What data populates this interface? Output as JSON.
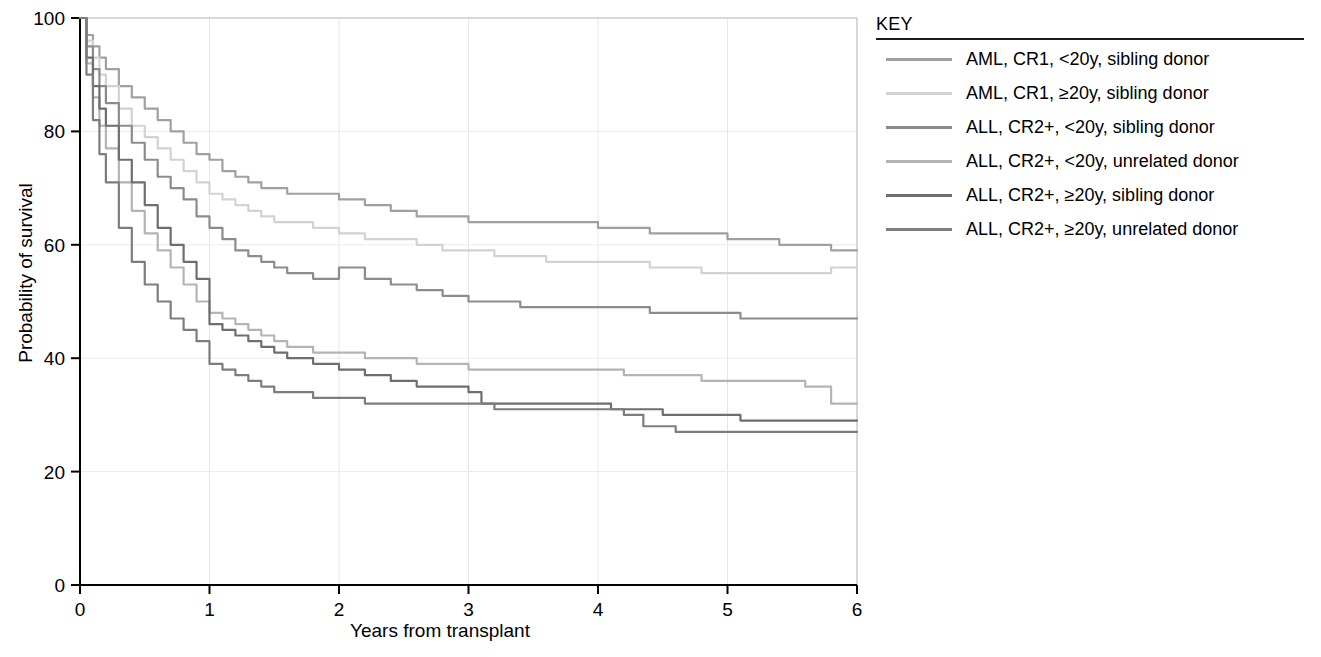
{
  "legend": {
    "title": "KEY",
    "entries": [
      {
        "label": "AML, CR1, <20y, sibling donor",
        "color": "#a0a0a0"
      },
      {
        "label": "AML, CR1, ≥20y, sibling donor",
        "color": "#d2d2d2"
      },
      {
        "label": "ALL, CR2+, <20y, sibling donor",
        "color": "#8c8c8c"
      },
      {
        "label": "ALL, CR2+, <20y, unrelated donor",
        "color": "#b4b4b4"
      },
      {
        "label": "ALL, CR2+, ≥20y, sibling donor",
        "color": "#6e6e6e"
      },
      {
        "label": "ALL, CR2+, ≥20y, unrelated donor",
        "color": "#7d7d7d"
      }
    ]
  },
  "axes": {
    "x_label": "Years from transplant",
    "y_label": "Probability of survival",
    "x_ticks": [
      "0",
      "1",
      "2",
      "3",
      "4",
      "5",
      "6"
    ],
    "y_ticks": [
      "0",
      "20",
      "40",
      "60",
      "80",
      "100"
    ]
  },
  "chart_data": {
    "type": "line",
    "title": "",
    "xlabel": "Years from transplant",
    "ylabel": "Probability of survival",
    "xlim": [
      0,
      6
    ],
    "ylim": [
      0,
      100
    ],
    "x_ticks": [
      0,
      1,
      2,
      3,
      4,
      5,
      6
    ],
    "y_ticks": [
      0,
      20,
      40,
      60,
      80,
      100
    ],
    "grid": true,
    "legend_position": "right",
    "legend_title": "KEY",
    "series": [
      {
        "name": "AML, CR1, <20y, sibling donor",
        "color": "#a0a0a0",
        "points": [
          [
            0.0,
            100
          ],
          [
            0.05,
            97
          ],
          [
            0.1,
            95
          ],
          [
            0.15,
            93
          ],
          [
            0.2,
            91
          ],
          [
            0.3,
            88
          ],
          [
            0.4,
            86
          ],
          [
            0.5,
            84
          ],
          [
            0.6,
            82
          ],
          [
            0.7,
            80
          ],
          [
            0.8,
            78
          ],
          [
            0.9,
            76
          ],
          [
            1.0,
            75
          ],
          [
            1.1,
            73
          ],
          [
            1.2,
            72
          ],
          [
            1.3,
            71
          ],
          [
            1.4,
            70
          ],
          [
            1.5,
            70
          ],
          [
            1.6,
            69
          ],
          [
            1.8,
            69
          ],
          [
            2.0,
            68
          ],
          [
            2.2,
            67
          ],
          [
            2.4,
            66
          ],
          [
            2.6,
            65
          ],
          [
            2.8,
            65
          ],
          [
            3.0,
            64
          ],
          [
            3.2,
            64
          ],
          [
            3.4,
            64
          ],
          [
            3.6,
            64
          ],
          [
            3.8,
            64
          ],
          [
            4.0,
            63
          ],
          [
            4.2,
            63
          ],
          [
            4.4,
            62
          ],
          [
            4.6,
            62
          ],
          [
            4.8,
            62
          ],
          [
            5.0,
            61
          ],
          [
            5.2,
            61
          ],
          [
            5.4,
            60
          ],
          [
            5.6,
            60
          ],
          [
            5.8,
            59
          ],
          [
            6.0,
            59
          ]
        ]
      },
      {
        "name": "AML, CR1, ≥20y, sibling donor",
        "color": "#d2d2d2",
        "points": [
          [
            0.0,
            100
          ],
          [
            0.05,
            96
          ],
          [
            0.1,
            93
          ],
          [
            0.15,
            90
          ],
          [
            0.2,
            88
          ],
          [
            0.3,
            84
          ],
          [
            0.4,
            81
          ],
          [
            0.5,
            79
          ],
          [
            0.6,
            77
          ],
          [
            0.7,
            75
          ],
          [
            0.8,
            73
          ],
          [
            0.9,
            71
          ],
          [
            1.0,
            69
          ],
          [
            1.1,
            68
          ],
          [
            1.2,
            67
          ],
          [
            1.3,
            66
          ],
          [
            1.4,
            65
          ],
          [
            1.5,
            64
          ],
          [
            1.6,
            64
          ],
          [
            1.8,
            63
          ],
          [
            2.0,
            62
          ],
          [
            2.2,
            61
          ],
          [
            2.4,
            61
          ],
          [
            2.6,
            60
          ],
          [
            2.8,
            59
          ],
          [
            3.0,
            59
          ],
          [
            3.2,
            58
          ],
          [
            3.4,
            58
          ],
          [
            3.6,
            57
          ],
          [
            3.8,
            57
          ],
          [
            4.0,
            57
          ],
          [
            4.2,
            57
          ],
          [
            4.4,
            56
          ],
          [
            4.6,
            56
          ],
          [
            4.8,
            55
          ],
          [
            5.0,
            55
          ],
          [
            5.2,
            55
          ],
          [
            5.4,
            55
          ],
          [
            5.6,
            55
          ],
          [
            5.8,
            56
          ],
          [
            6.0,
            56
          ]
        ]
      },
      {
        "name": "ALL, CR2+, <20y, sibling donor",
        "color": "#8c8c8c",
        "points": [
          [
            0.0,
            100
          ],
          [
            0.05,
            95
          ],
          [
            0.1,
            91
          ],
          [
            0.15,
            88
          ],
          [
            0.2,
            85
          ],
          [
            0.3,
            81
          ],
          [
            0.4,
            78
          ],
          [
            0.5,
            75
          ],
          [
            0.6,
            72
          ],
          [
            0.7,
            70
          ],
          [
            0.8,
            68
          ],
          [
            0.9,
            65
          ],
          [
            1.0,
            63
          ],
          [
            1.1,
            61
          ],
          [
            1.2,
            59
          ],
          [
            1.3,
            58
          ],
          [
            1.4,
            57
          ],
          [
            1.5,
            56
          ],
          [
            1.6,
            55
          ],
          [
            1.8,
            54
          ],
          [
            2.0,
            56
          ],
          [
            2.2,
            54
          ],
          [
            2.4,
            53
          ],
          [
            2.6,
            52
          ],
          [
            2.8,
            51
          ],
          [
            3.0,
            50
          ],
          [
            3.2,
            50
          ],
          [
            3.4,
            49
          ],
          [
            3.6,
            49
          ],
          [
            3.8,
            49
          ],
          [
            4.0,
            49
          ],
          [
            4.2,
            49
          ],
          [
            4.4,
            48
          ],
          [
            4.6,
            48
          ],
          [
            4.8,
            48
          ],
          [
            5.0,
            48
          ],
          [
            5.1,
            47
          ],
          [
            5.3,
            47
          ],
          [
            5.6,
            47
          ],
          [
            5.8,
            47
          ],
          [
            6.0,
            47
          ]
        ]
      },
      {
        "name": "ALL, CR2+, <20y, unrelated donor",
        "color": "#b4b4b4",
        "points": [
          [
            0.0,
            100
          ],
          [
            0.05,
            92
          ],
          [
            0.1,
            86
          ],
          [
            0.15,
            81
          ],
          [
            0.2,
            77
          ],
          [
            0.3,
            71
          ],
          [
            0.4,
            66
          ],
          [
            0.5,
            62
          ],
          [
            0.6,
            59
          ],
          [
            0.7,
            56
          ],
          [
            0.8,
            53
          ],
          [
            0.9,
            50
          ],
          [
            1.0,
            48
          ],
          [
            1.1,
            47
          ],
          [
            1.2,
            46
          ],
          [
            1.3,
            45
          ],
          [
            1.4,
            44
          ],
          [
            1.5,
            43
          ],
          [
            1.6,
            42
          ],
          [
            1.8,
            41
          ],
          [
            2.0,
            41
          ],
          [
            2.2,
            40
          ],
          [
            2.4,
            40
          ],
          [
            2.6,
            39
          ],
          [
            2.8,
            39
          ],
          [
            3.0,
            38
          ],
          [
            3.2,
            38
          ],
          [
            3.4,
            38
          ],
          [
            3.6,
            38
          ],
          [
            3.8,
            38
          ],
          [
            4.0,
            38
          ],
          [
            4.2,
            37
          ],
          [
            4.4,
            37
          ],
          [
            4.6,
            37
          ],
          [
            4.8,
            36
          ],
          [
            5.0,
            36
          ],
          [
            5.2,
            36
          ],
          [
            5.4,
            36
          ],
          [
            5.6,
            35
          ],
          [
            5.8,
            32
          ],
          [
            6.0,
            32
          ]
        ]
      },
      {
        "name": "ALL, CR2+, ≥20y, sibling donor",
        "color": "#6e6e6e",
        "points": [
          [
            0.0,
            100
          ],
          [
            0.05,
            93
          ],
          [
            0.1,
            88
          ],
          [
            0.15,
            84
          ],
          [
            0.2,
            81
          ],
          [
            0.3,
            75
          ],
          [
            0.4,
            71
          ],
          [
            0.5,
            67
          ],
          [
            0.6,
            63
          ],
          [
            0.7,
            60
          ],
          [
            0.8,
            57
          ],
          [
            0.9,
            54
          ],
          [
            1.0,
            46
          ],
          [
            1.1,
            45
          ],
          [
            1.2,
            44
          ],
          [
            1.3,
            43
          ],
          [
            1.4,
            42
          ],
          [
            1.5,
            41
          ],
          [
            1.6,
            40
          ],
          [
            1.8,
            39
          ],
          [
            2.0,
            38
          ],
          [
            2.2,
            37
          ],
          [
            2.4,
            36
          ],
          [
            2.6,
            35
          ],
          [
            2.8,
            35
          ],
          [
            3.0,
            34
          ],
          [
            3.1,
            32
          ],
          [
            3.3,
            32
          ],
          [
            3.6,
            32
          ],
          [
            3.8,
            32
          ],
          [
            4.0,
            32
          ],
          [
            4.1,
            31
          ],
          [
            4.3,
            31
          ],
          [
            4.5,
            30
          ],
          [
            4.7,
            30
          ],
          [
            5.0,
            30
          ],
          [
            5.1,
            29
          ],
          [
            5.4,
            29
          ],
          [
            5.7,
            29
          ],
          [
            5.9,
            29
          ],
          [
            6.0,
            29
          ]
        ]
      },
      {
        "name": "ALL, CR2+, ≥20y, unrelated donor",
        "color": "#7d7d7d",
        "points": [
          [
            0.0,
            100
          ],
          [
            0.05,
            90
          ],
          [
            0.1,
            82
          ],
          [
            0.15,
            76
          ],
          [
            0.2,
            71
          ],
          [
            0.3,
            63
          ],
          [
            0.4,
            57
          ],
          [
            0.5,
            53
          ],
          [
            0.6,
            50
          ],
          [
            0.7,
            47
          ],
          [
            0.8,
            45
          ],
          [
            0.9,
            43
          ],
          [
            1.0,
            39
          ],
          [
            1.1,
            38
          ],
          [
            1.2,
            37
          ],
          [
            1.3,
            36
          ],
          [
            1.4,
            35
          ],
          [
            1.5,
            34
          ],
          [
            1.6,
            34
          ],
          [
            1.8,
            33
          ],
          [
            2.0,
            33
          ],
          [
            2.2,
            32
          ],
          [
            2.4,
            32
          ],
          [
            2.6,
            32
          ],
          [
            2.8,
            32
          ],
          [
            3.0,
            32
          ],
          [
            3.2,
            31
          ],
          [
            3.4,
            31
          ],
          [
            3.6,
            31
          ],
          [
            3.8,
            31
          ],
          [
            4.0,
            31
          ],
          [
            4.2,
            30
          ],
          [
            4.35,
            28
          ],
          [
            4.6,
            27
          ],
          [
            4.8,
            27
          ],
          [
            5.0,
            27
          ],
          [
            5.2,
            27
          ],
          [
            5.4,
            27
          ],
          [
            5.6,
            27
          ],
          [
            5.8,
            27
          ],
          [
            6.0,
            27
          ]
        ]
      }
    ]
  }
}
